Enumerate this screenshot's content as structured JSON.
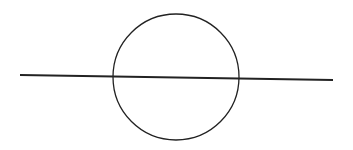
{
  "diagram": {
    "background": "#ffffff",
    "stroke_color": "#222222",
    "circle": {
      "cx": 176,
      "cy": 77,
      "r": 63,
      "stroke_width": 1.3
    },
    "line": {
      "x1": 20,
      "y1": 75,
      "x2": 333,
      "y2": 80,
      "stroke_width": 1.8
    }
  }
}
